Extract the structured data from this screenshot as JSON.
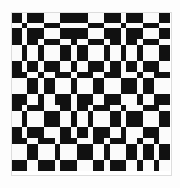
{
  "figure": {
    "type": "monochrome-grid-pattern",
    "canvas_width": 180,
    "canvas_height": 188,
    "background_color": "#fdfdfd",
    "pattern": {
      "origin_x": 11,
      "origin_y": 12,
      "width": 161,
      "height": 164,
      "fill_color": "#111111",
      "empty_color": "#fbfbfb",
      "edge_color": "#dddddd",
      "column_widths": [
        11,
        5,
        11,
        6,
        11,
        5,
        11,
        6,
        11,
        5,
        11,
        6,
        11,
        5,
        11,
        6,
        11,
        5,
        11
      ],
      "row_heights": [
        11,
        5,
        11,
        6,
        11,
        5,
        11,
        6,
        11,
        5,
        11,
        6,
        11,
        5,
        11,
        6,
        11,
        5,
        11
      ],
      "columns": 19,
      "rows": 19,
      "matrix": [
        [
          1,
          0,
          1,
          1,
          0,
          0,
          1,
          1,
          1,
          0,
          0,
          1,
          1,
          0,
          1,
          1,
          0,
          0,
          1
        ],
        [
          0,
          1,
          0,
          0,
          1,
          1,
          0,
          0,
          0,
          1,
          1,
          0,
          0,
          1,
          0,
          0,
          1,
          1,
          0
        ],
        [
          1,
          0,
          1,
          1,
          0,
          0,
          1,
          1,
          1,
          0,
          0,
          1,
          1,
          0,
          1,
          1,
          0,
          0,
          1
        ],
        [
          1,
          0,
          1,
          0,
          1,
          1,
          0,
          1,
          0,
          1,
          1,
          0,
          1,
          0,
          1,
          0,
          1,
          1,
          0
        ],
        [
          0,
          1,
          0,
          1,
          0,
          0,
          1,
          0,
          1,
          0,
          0,
          1,
          0,
          1,
          0,
          1,
          0,
          0,
          1
        ],
        [
          0,
          1,
          0,
          1,
          0,
          0,
          1,
          0,
          1,
          0,
          0,
          1,
          0,
          1,
          0,
          1,
          0,
          0,
          1
        ],
        [
          1,
          0,
          1,
          0,
          1,
          1,
          0,
          1,
          0,
          1,
          1,
          0,
          1,
          0,
          1,
          0,
          1,
          1,
          0
        ],
        [
          1,
          1,
          0,
          1,
          0,
          1,
          1,
          0,
          1,
          1,
          0,
          1,
          1,
          0,
          0,
          1,
          0,
          1,
          1
        ],
        [
          0,
          0,
          1,
          0,
          1,
          0,
          0,
          1,
          0,
          0,
          1,
          0,
          0,
          1,
          1,
          0,
          1,
          0,
          0
        ],
        [
          0,
          0,
          1,
          0,
          1,
          0,
          0,
          1,
          0,
          0,
          1,
          0,
          0,
          1,
          1,
          0,
          1,
          0,
          0
        ],
        [
          1,
          1,
          0,
          1,
          0,
          1,
          1,
          0,
          1,
          1,
          0,
          1,
          1,
          0,
          0,
          1,
          0,
          1,
          1
        ],
        [
          1,
          0,
          1,
          1,
          0,
          0,
          1,
          0,
          1,
          0,
          1,
          1,
          0,
          1,
          0,
          0,
          1,
          1,
          0
        ],
        [
          0,
          1,
          0,
          0,
          1,
          1,
          0,
          1,
          0,
          1,
          0,
          0,
          1,
          0,
          1,
          1,
          0,
          0,
          1
        ],
        [
          0,
          1,
          0,
          0,
          1,
          1,
          0,
          1,
          0,
          1,
          0,
          0,
          1,
          0,
          1,
          1,
          0,
          0,
          1
        ],
        [
          1,
          0,
          1,
          1,
          0,
          0,
          1,
          0,
          1,
          0,
          1,
          1,
          0,
          1,
          0,
          0,
          1,
          1,
          0
        ],
        [
          1,
          1,
          0,
          1,
          1,
          0,
          1,
          1,
          0,
          0,
          1,
          0,
          1,
          1,
          0,
          1,
          0,
          1,
          0
        ],
        [
          0,
          0,
          1,
          0,
          0,
          1,
          0,
          0,
          1,
          1,
          0,
          1,
          0,
          0,
          1,
          0,
          1,
          0,
          1
        ],
        [
          0,
          0,
          1,
          0,
          0,
          1,
          0,
          0,
          1,
          1,
          0,
          1,
          0,
          0,
          1,
          0,
          1,
          0,
          1
        ],
        [
          1,
          1,
          0,
          1,
          1,
          0,
          1,
          1,
          0,
          0,
          1,
          0,
          1,
          1,
          0,
          1,
          0,
          1,
          0
        ]
      ]
    }
  }
}
